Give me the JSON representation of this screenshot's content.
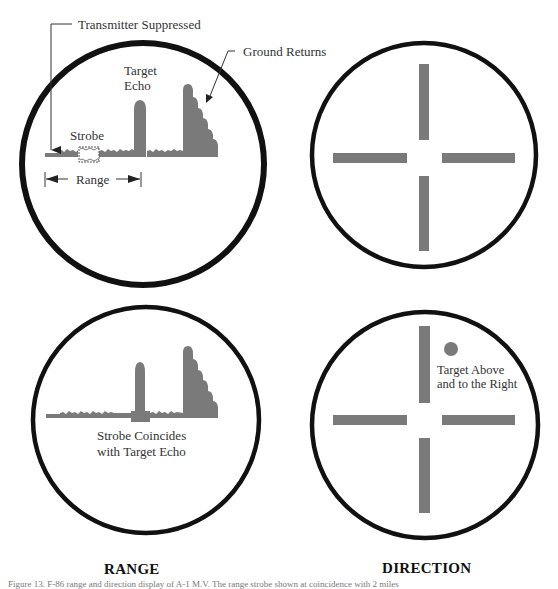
{
  "figure": {
    "range_panel_title": "RANGE",
    "direction_panel_title": "DIRECTION",
    "caption": "Figure 13. F-86 range and direction display of A-1 M.V. The range strobe shown at coincidence with 2 miles"
  },
  "range_top": {
    "label_transmitter_suppressed": "Transmitter Suppressed",
    "label_ground_returns": "Ground Returns",
    "label_target_echo_line1": "Target",
    "label_target_echo_line2": "Echo",
    "label_strobe": "Strobe",
    "label_range": "Range"
  },
  "range_bottom": {
    "label_line1": "Strobe Coincides",
    "label_line2": "with Target Echo"
  },
  "direction_bottom": {
    "label_line1": "Target Above",
    "label_line2": "and to the Right"
  },
  "colors": {
    "circle_stroke": "#111111",
    "signal_fill": "#7a7a7a",
    "text": "#333333"
  }
}
